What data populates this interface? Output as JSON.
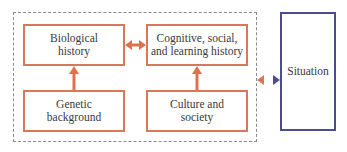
{
  "diagram": {
    "colors": {
      "node_border": "#d9775a",
      "arrow": "#e0704f",
      "situation_border": "#4b4d8f",
      "dashed_group": "#8a8a8a",
      "text": "#3a3a3a"
    },
    "nodes": {
      "biological_history": "Biological\nhistory",
      "cognitive_history": "Cognitive, social,\nand learning history",
      "genetic_background": "Genetic\nbackground",
      "culture_society": "Culture and\nsociety",
      "situation": "Situation"
    },
    "edges": [
      {
        "from": "biological_history",
        "to": "cognitive_history",
        "type": "bidirectional"
      },
      {
        "from": "genetic_background",
        "to": "biological_history",
        "type": "directed"
      },
      {
        "from": "culture_society",
        "to": "cognitive_history",
        "type": "directed"
      },
      {
        "from": "person_group",
        "to": "situation",
        "type": "bidirectional"
      }
    ]
  }
}
